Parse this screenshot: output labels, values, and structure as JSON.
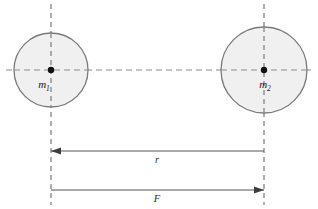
{
  "figure": {
    "background_color": "#ffffff"
  },
  "bodies": [
    {
      "id": "mass-1",
      "label_base": "m",
      "label_sub": "1",
      "center_x": 51,
      "center_y": 70,
      "radius": 37,
      "fill_color": "#f0f0f0",
      "stroke_color": "#808080"
    },
    {
      "id": "mass-2",
      "label_base": "m",
      "label_sub": "2",
      "center_x": 264,
      "center_y": 70,
      "radius": 43,
      "fill_color": "#f0f0f0",
      "stroke_color": "#808080"
    }
  ],
  "guides": {
    "vertical_left": {
      "x": 51,
      "y_top": 4,
      "y_bottom": 205
    },
    "vertical_right": {
      "x": 264,
      "y_top": 4,
      "y_bottom": 205
    },
    "horizontal_center": {
      "y": 70,
      "x_start": 6,
      "x_end": 311
    },
    "dash_color": "#8c8c8c"
  },
  "dimensions": [
    {
      "id": "separation",
      "label": "r",
      "y": 151,
      "x_start": 51,
      "x_end": 264,
      "arrow_direction": "left",
      "line_color": "#555555"
    },
    {
      "id": "force",
      "label": "F",
      "y": 190,
      "x_start": 51,
      "x_end": 264,
      "arrow_direction": "right",
      "line_color": "#555555"
    }
  ],
  "center_dots": {
    "radius": 3.2,
    "color": "#111111"
  }
}
